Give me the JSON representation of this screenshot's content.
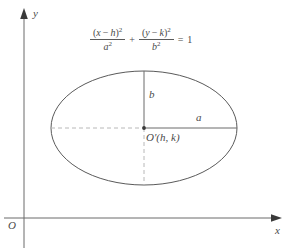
{
  "figure": {
    "axes": {
      "y_label": "y",
      "x_label": "x",
      "origin_label": "O"
    },
    "equation": {
      "full": "(x - h)^2 / a^2 + (y - k)^2 / b^2 = 1",
      "term1_numerator_open": "(",
      "term1_numerator_var": "x",
      "term1_numerator_minus": "−",
      "term1_numerator_param": "h",
      "term1_numerator_close": ")",
      "term1_numerator_exp": "2",
      "term1_denominator_var": "a",
      "term1_denominator_exp": "2",
      "plus": "+",
      "term2_numerator_open": "(",
      "term2_numerator_var": "y",
      "term2_numerator_minus": "−",
      "term2_numerator_param": "k",
      "term2_numerator_close": ")",
      "term2_numerator_exp": "2",
      "term2_denominator_var": "b",
      "term2_denominator_exp": "2",
      "equals": "=",
      "rhs": "1"
    },
    "ellipse": {
      "center_label": "O′(h, k)",
      "semi_major_label": "a",
      "semi_minor_label": "b",
      "center_x": 144,
      "center_y": 128,
      "semi_axis_a": 93,
      "semi_axis_b": 57
    },
    "colors": {
      "curve": "#5a5a5a",
      "axis": "#6b6b6b",
      "dashed": "#b0b0b0",
      "text": "#4a4a4a",
      "background": "#ffffff"
    }
  }
}
